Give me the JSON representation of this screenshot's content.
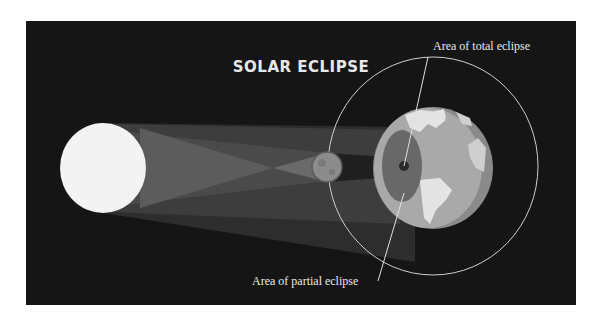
{
  "diagram": {
    "title": "SOLAR ECLIPSE",
    "labels": {
      "total": "Area of total eclipse",
      "partial": "Area of partial eclipse"
    },
    "bodies": {
      "sun": "Sun",
      "moon": "Moon",
      "earth": "Earth",
      "orbit": "Moon orbit"
    },
    "colors": {
      "page": "#ffffff",
      "panel": "#151515",
      "sun": "#f3f3f3",
      "moon": "#8c8c8c",
      "earth_ocean": "#a9a9a9",
      "earth_land": "#e4e4e4",
      "earth_night": "#8a8a8a",
      "penumbra_outer": "#3a3a3a",
      "penumbra_inner": "#5e5e5e",
      "umbra": "#262626",
      "orbit_line": "#cfcfcf",
      "text": "#e8e8e8"
    }
  }
}
